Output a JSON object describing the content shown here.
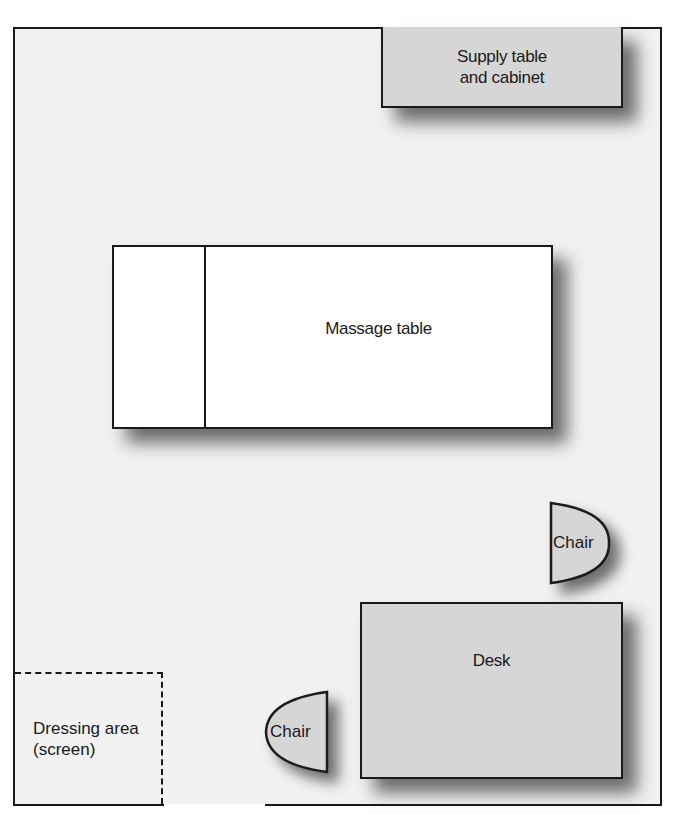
{
  "diagram": {
    "items": {
      "supply_table": {
        "label_line1": "Supply table",
        "label_line2": "and cabinet"
      },
      "massage_table": {
        "label": "Massage table"
      },
      "chair_right": {
        "label": "Chair"
      },
      "desk": {
        "label": "Desk"
      },
      "chair_left": {
        "label": "Chair"
      },
      "dressing_area": {
        "label_line1": "Dressing area",
        "label_line2": "(screen)"
      }
    },
    "colors": {
      "floor": "#f1f1f1",
      "furniture_gray": "#d6d6d6",
      "massage_table": "#ffffff",
      "outline": "#1a1a1a"
    }
  }
}
